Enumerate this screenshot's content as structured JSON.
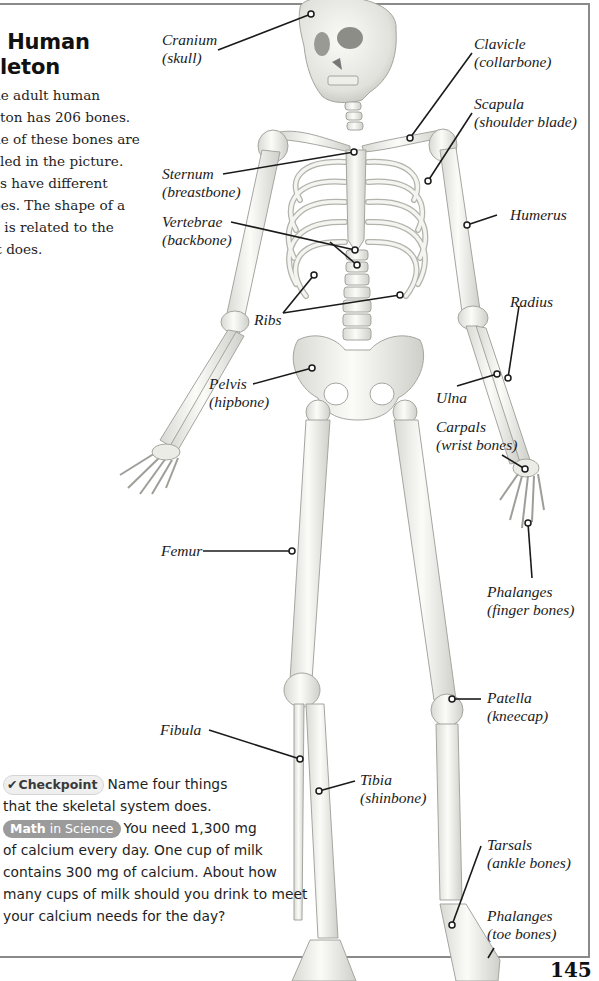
{
  "page": {
    "title_lines": [
      "e Human",
      "eleton"
    ],
    "intro_lines": [
      "he adult human",
      "eton has 206 bones.",
      "ne of these bones are",
      "eled in the picture.",
      "es have different",
      "pes. The shape of a",
      "e is related to the",
      "it does."
    ],
    "page_number": "145"
  },
  "labels": {
    "cranium": {
      "name": "Cranium",
      "common": "(skull)"
    },
    "clavicle": {
      "name": "Clavicle",
      "common": "(collarbone)"
    },
    "scapula": {
      "name": "Scapula",
      "common": "(shoulder blade)"
    },
    "sternum": {
      "name": "Sternum",
      "common": "(breastbone)"
    },
    "vertebrae": {
      "name": "Vertebrae",
      "common": "(backbone)"
    },
    "humerus": {
      "name": "Humerus"
    },
    "ribs": {
      "name": "Ribs"
    },
    "radius": {
      "name": "Radius"
    },
    "pelvis": {
      "name": "Pelvis",
      "common": "(hipbone)"
    },
    "ulna": {
      "name": "Ulna"
    },
    "carpals": {
      "name": "Carpals",
      "common": "(wrist bones)"
    },
    "femur": {
      "name": "Femur"
    },
    "phalanges_hand": {
      "name": "Phalanges",
      "common": "(finger bones)"
    },
    "patella": {
      "name": "Patella",
      "common": "(kneecap)"
    },
    "fibula": {
      "name": "Fibula"
    },
    "tibia": {
      "name": "Tibia",
      "common": "(shinbone)"
    },
    "tarsals": {
      "name": "Tarsals",
      "common": "(ankle bones)"
    },
    "phalanges_foot": {
      "name": "Phalanges",
      "common": "(toe bones)"
    }
  },
  "checkpoint": {
    "badge_label": "Checkpoint",
    "badge_icon": "checkmark-icon",
    "line1": "Name four things",
    "line2": "that the skeletal system does.",
    "math_badge_bold": "Math",
    "math_badge_rest": " in Science",
    "math_line1": "You need 1,300 mg",
    "math_line2": "of calcium every day. One cup of milk",
    "math_line3": "contains 300 mg of calcium. About how",
    "math_line4": "many cups of milk should you drink to meet",
    "math_line5": "your calcium needs for the day?"
  },
  "colors": {
    "frame": "#8a8a8a",
    "bone_fill": "#f2f2ee",
    "bone_stroke": "#a8a8a2",
    "leader": "#1a1a1a",
    "math_badge_bg": "#9b9b9b"
  }
}
